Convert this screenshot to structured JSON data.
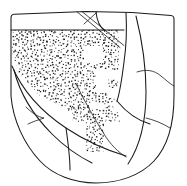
{
  "figure": {
    "technique": "ink line drawing with stipple shading",
    "width_px": 187,
    "height_px": 186,
    "background_color": "#ffffff",
    "ink_color": "#1a1a1a",
    "stipple_color": "#222222",
    "stipple_dot_size_px": 1.1,
    "stipple_spacing_px": 3.1
  },
  "regions": [
    {
      "id": "rim-band",
      "label": "plain rim band",
      "fill": "blank",
      "position": "top-left across upper edge"
    },
    {
      "id": "upper-stipple-field",
      "label": "upper stippled field",
      "fill": "stipple",
      "position": "left and centre, below rim band"
    },
    {
      "id": "reserved-square-upper",
      "label": "reserved blank square motif",
      "fill": "blank",
      "position": "centre of upper stipple field"
    },
    {
      "id": "reserved-step-centre",
      "label": "reserved stepped blank motif",
      "fill": "blank",
      "position": "centre-right of stipple field"
    },
    {
      "id": "lower-stipple-block",
      "label": "lower stippled block",
      "fill": "stipple",
      "position": "lower centre"
    },
    {
      "id": "right-blank-panel",
      "label": "plain right panel",
      "fill": "blank",
      "position": "right side of sherd"
    },
    {
      "id": "lower-left-blank-panel",
      "label": "plain lower-left panel",
      "fill": "blank",
      "position": "lower-left of sherd"
    },
    {
      "id": "notch-spur",
      "label": "pointed notch detail",
      "fill": "blank",
      "position": "left side, mid-lower"
    }
  ],
  "incised_lines": [
    {
      "id": "diagonal-a",
      "label": "upper diagonal incision"
    },
    {
      "id": "diagonal-b",
      "label": "second upper diagonal incision"
    },
    {
      "id": "panel-divider-right",
      "label": "right panel divider"
    },
    {
      "id": "panel-divider-lower",
      "label": "lower panel divider"
    },
    {
      "id": "sweep-left",
      "label": "left sweeping contour"
    },
    {
      "id": "sweep-centre",
      "label": "central contour through stipple"
    }
  ],
  "stipple_geometry": {
    "upper_field": {
      "x": 12,
      "y": 30,
      "width": 112,
      "height": 78
    },
    "lower_block": {
      "x": 68,
      "y": 104,
      "width": 52,
      "height": 48
    },
    "reserved_square": {
      "x": 84,
      "y": 46,
      "width": 18,
      "height": 17
    },
    "reserved_step": {
      "x": 96,
      "y": 72,
      "width": 26,
      "height": 20
    },
    "reserved_notch_lower": {
      "x": 90,
      "y": 104,
      "width": 14,
      "height": 13
    }
  }
}
